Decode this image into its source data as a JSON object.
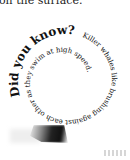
{
  "page": {
    "top_text": "on the surface.",
    "heading": "Did you know?",
    "spiral_text": "Killer whales like brushing against each other as they swim at high speed."
  }
}
